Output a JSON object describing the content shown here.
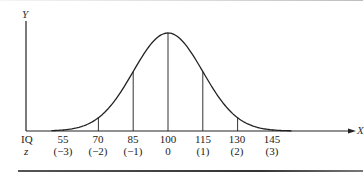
{
  "chart_data": {
    "type": "line",
    "title": "",
    "xlabel": "X",
    "ylabel": "Y",
    "row_labels": {
      "iq": "IQ",
      "z": "z"
    },
    "categories": [
      "55",
      "70",
      "85",
      "100",
      "115",
      "130",
      "145"
    ],
    "z_labels": [
      "(−3)",
      "(−2)",
      "(−1)",
      "0",
      "(1)",
      "(2)",
      "(3)"
    ],
    "iq_values": [
      55,
      70,
      85,
      100,
      115,
      130,
      145
    ],
    "z_values": [
      -3,
      -2,
      -1,
      0,
      1,
      2,
      3
    ],
    "mean": 100,
    "sd": 15,
    "series": [
      {
        "name": "normal curve",
        "x": [
          55,
          70,
          85,
          100,
          115,
          130,
          145
        ],
        "y_relative": [
          0.011,
          0.135,
          0.607,
          1.0,
          0.607,
          0.135,
          0.011
        ]
      }
    ],
    "vertical_lines_at": [
      55,
      70,
      85,
      100,
      115,
      130,
      145
    ],
    "grid": false,
    "legend": null
  }
}
